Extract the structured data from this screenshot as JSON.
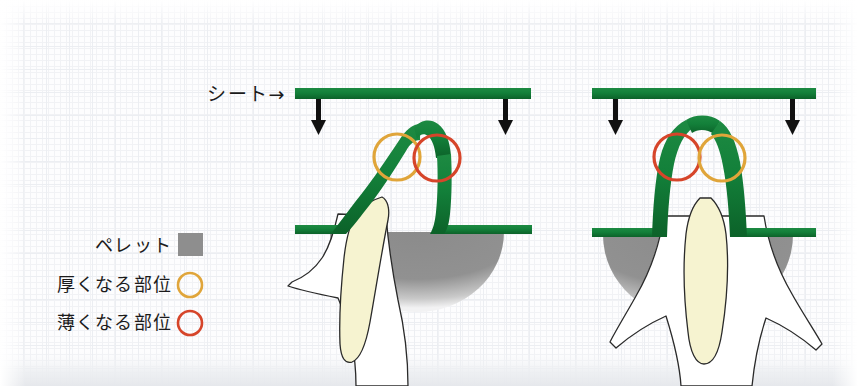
{
  "figure": {
    "width": 858,
    "height": 386,
    "background_color": "#fdfdfe",
    "paper_texture": true
  },
  "annotations": {
    "sheet_label": "シート→",
    "sheet_label_text": "シート",
    "sheet_arrow_glyph": "→"
  },
  "legend": {
    "items": [
      {
        "label": "ペレット",
        "marker": "filled-square",
        "marker_name": "pellet-swatch",
        "color": "#8e8e8e"
      },
      {
        "label": "厚くなる部位",
        "marker": "open-circle",
        "marker_name": "thickening-circle",
        "color": "#e0a53a"
      },
      {
        "label": "薄くなる部位",
        "marker": "open-circle",
        "marker_name": "thinning-circle",
        "color": "#d6452a"
      }
    ]
  },
  "colors": {
    "sheet_green": "#127a37",
    "sheet_green_dark": "#0d5c28",
    "tooth_cream": "#f6f3d0",
    "tooth_outline": "#2a2a2a",
    "gum_white": "#ffffff",
    "pellet_gray": "#8e8e8e",
    "pellet_gray_light": "#9a9a9a",
    "arrow_black": "#111111",
    "orange": "#e0a53a",
    "red": "#d6452a"
  },
  "panels": [
    {
      "name": "left-panel",
      "description": "傾斜した歯にシートが圧接された状態",
      "sheet_bar": {
        "x": 295,
        "y": 88,
        "width": 236,
        "height": 11
      },
      "arrows": [
        {
          "x": 319,
          "y_top": 99,
          "y_bottom": 134
        },
        {
          "x": 506,
          "y_top": 99,
          "y_bottom": 134
        }
      ],
      "markers": [
        {
          "type": "thickening",
          "cx": 397,
          "cy": 157,
          "r": 23,
          "color": "#e0a53a"
        },
        {
          "type": "thinning",
          "cx": 437,
          "cy": 158,
          "r": 23,
          "color": "#d6452a"
        }
      ]
    },
    {
      "name": "right-panel",
      "description": "直立した歯にシートが圧接された状態",
      "sheet_bar": {
        "x": 592,
        "y": 88,
        "width": 224,
        "height": 11
      },
      "arrows": [
        {
          "x": 616,
          "y_top": 99,
          "y_bottom": 134
        },
        {
          "x": 793,
          "y_top": 99,
          "y_bottom": 134
        }
      ],
      "markers": [
        {
          "type": "thinning",
          "cx": 677,
          "cy": 157,
          "r": 23,
          "color": "#d6452a"
        },
        {
          "type": "thickening",
          "cx": 722,
          "cy": 158,
          "r": 23,
          "color": "#e0a53a"
        }
      ]
    }
  ]
}
